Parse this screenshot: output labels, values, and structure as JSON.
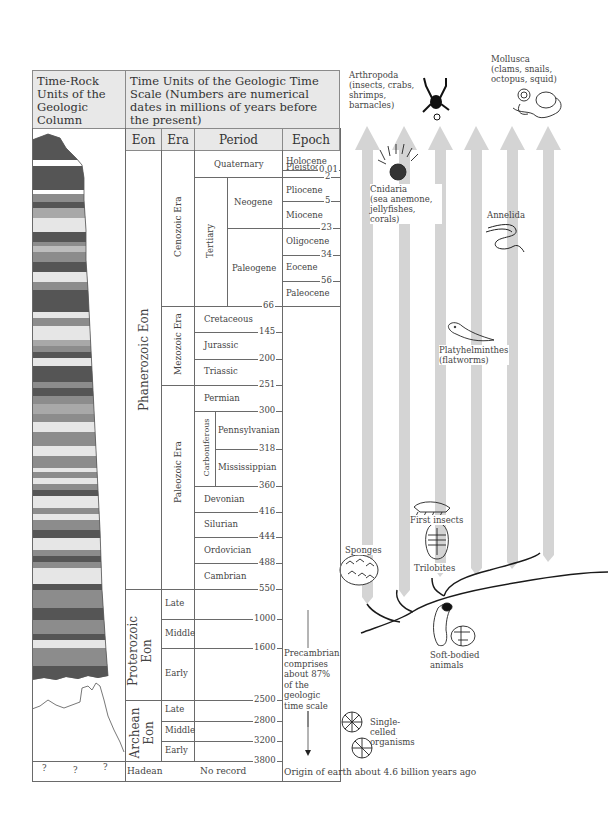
{
  "header": {
    "rock_units_title": "Time-Rock Units of the Geologic Column",
    "time_units_title": "Time Units of the Geologic Time Scale (Numbers are numerical dates in millions of years before the present)"
  },
  "columns": {
    "eon": "Eon",
    "era": "Era",
    "period": "Period",
    "epoch": "Epoch"
  },
  "eons": {
    "phanerozoic": "Phanerozoic Eon",
    "proterozoic": "Proterozoic Eon",
    "archean": "Archean Eon",
    "hadean": "Hadean"
  },
  "eras": {
    "cenozoic": "Cenozoic Era",
    "mesozoic": "Mezozoic Era",
    "paleozoic": "Paleozoic Era",
    "proterozoic_late": "Late",
    "proterozoic_middle": "Middle",
    "proterozoic_early": "Early",
    "archean_late": "Late",
    "archean_middle": "Middle",
    "archean_early": "Early",
    "no_record": "No record"
  },
  "periods": {
    "quaternary": "Quaternary",
    "tertiary": "Tertiary",
    "neogene": "Neogene",
    "paleogene": "Paleogene",
    "cretaceous": "Cretaceous",
    "jurassic": "Jurassic",
    "triassic": "Triassic",
    "permian": "Permian",
    "carboniferous": "Carboniferous",
    "pennsylvanian": "Pennsylvanian",
    "mississippian": "Mississippian",
    "devonian": "Devonian",
    "silurian": "Silurian",
    "ordovician": "Ordovician",
    "cambrian": "Cambrian"
  },
  "epochs": {
    "holocene": "Holocene",
    "pleistocene": "Pleistocene",
    "pliocene": "Pliocene",
    "miocene": "Miocene",
    "oligocene": "Oligocene",
    "eocene": "Eocene",
    "paleocene": "Paleocene"
  },
  "dates": {
    "d001": "0.01",
    "d2": "2",
    "d5": "5",
    "d23": "23",
    "d34": "34",
    "d56": "56",
    "d66": "66",
    "d145": "145",
    "d200": "200",
    "d251": "251",
    "d300": "300",
    "d318": "318",
    "d360": "360",
    "d416": "416",
    "d444": "444",
    "d488": "488",
    "d550": "550",
    "d1000": "1000",
    "d1600": "1600",
    "d2500": "2500",
    "d2800": "2800",
    "d3200": "3200",
    "d3800": "3800"
  },
  "precambrian_note": "Precambrian comprises about 87% of the geologic time scale",
  "origin_note": "Origin of earth about 4.6 billion years ago",
  "question_marks": [
    "?",
    "?",
    "?"
  ],
  "organisms": {
    "arthropoda": {
      "name": "Arthropoda",
      "desc": "(insects, crabs, shrimps, barnacles)"
    },
    "mollusca": {
      "name": "Mollusca",
      "desc": "(clams, snails, octopus, squid)"
    },
    "cnidaria": {
      "name": "Cnidaria",
      "desc": "(sea anemone, jellyfishes, corals)"
    },
    "annelida": {
      "name": "Annelida"
    },
    "platyhelminthes": {
      "name": "Platyhelminthes",
      "desc": "(flatworms)"
    },
    "first_insects": {
      "name": "First insects"
    },
    "trilobites": {
      "name": "Trilobites"
    },
    "sponges": {
      "name": "Sponges"
    },
    "soft_bodied": {
      "name": "Soft-bodied animals"
    },
    "single_celled": {
      "name": "Single-celled organisms"
    }
  },
  "colors": {
    "header_bg": "#e8e8e8",
    "border": "#8a8a8a",
    "arrow": "#d4d4d4",
    "rock_dark": "#555555",
    "rock_mid": "#8c8c8c",
    "rock_light": "#e6e6e6"
  }
}
